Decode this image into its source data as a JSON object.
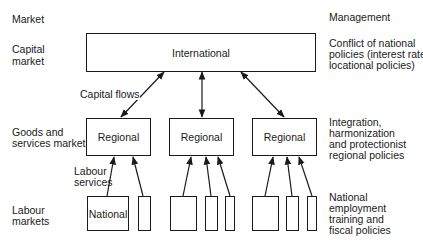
{
  "headers": {
    "left": "Market",
    "right": "Management"
  },
  "rows": [
    {
      "market": [
        "Capital",
        "market"
      ],
      "management": [
        "Conflict of national",
        "policies (interest rate,",
        "locational policies)"
      ]
    },
    {
      "market": [
        "Goods and",
        "services markets"
      ],
      "management": [
        "Integration,",
        "harmonization",
        "and protectionist",
        "regional policies"
      ]
    },
    {
      "market": [
        "Labour",
        "markets"
      ],
      "management": [
        "National",
        "employment",
        "training and",
        "fiscal policies"
      ]
    }
  ],
  "nodes": {
    "international": "International",
    "regional": [
      "Regional",
      "Regional",
      "Regional"
    ],
    "national": "National"
  },
  "edge_labels": {
    "capital_flows": "Capital flows",
    "labour_services": [
      "Labour",
      "services"
    ]
  }
}
